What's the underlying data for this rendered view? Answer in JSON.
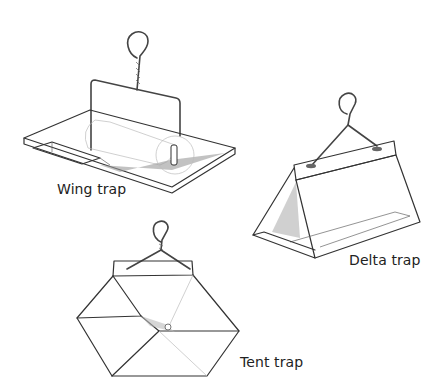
{
  "figure": {
    "traps": [
      {
        "id": "wing",
        "label": "Wing trap"
      },
      {
        "id": "delta",
        "label": "Delta trap"
      },
      {
        "id": "tent",
        "label": "Tent trap"
      }
    ]
  }
}
